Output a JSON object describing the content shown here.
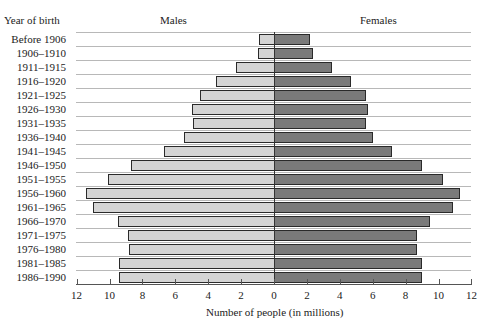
{
  "chart_data": {
    "type": "bar",
    "subtype": "population-pyramid (horizontal, back-to-back)",
    "title": "",
    "ylabel": "Year of birth",
    "xlabel": "Number of people (in millions)",
    "left_header": "Males",
    "right_header": "Females",
    "categories": [
      "Before 1906",
      "1906–1910",
      "1911–1915",
      "1916–1920",
      "1921–1925",
      "1926–1930",
      "1931–1935",
      "1936–1940",
      "1941–1945",
      "1946–1950",
      "1951–1955",
      "1956–1960",
      "1961–1965",
      "1966–1970",
      "1971–1975",
      "1976–1980",
      "1981–1985",
      "1986–1990"
    ],
    "series": [
      {
        "name": "Males",
        "color": "#d4d4d4",
        "side": "left",
        "values": [
          0.9,
          1.0,
          2.3,
          3.5,
          4.5,
          5.0,
          4.9,
          5.5,
          6.7,
          8.7,
          10.1,
          11.4,
          11.0,
          9.5,
          8.9,
          8.8,
          9.4,
          9.4
        ]
      },
      {
        "name": "Females",
        "color": "#7a7a7a",
        "side": "right",
        "values": [
          2.2,
          2.4,
          3.5,
          4.7,
          5.6,
          5.7,
          5.6,
          6.0,
          7.2,
          9.0,
          10.3,
          11.3,
          10.9,
          9.5,
          8.7,
          8.7,
          9.0,
          9.0
        ]
      }
    ],
    "x_ticks_left": [
      "12",
      "10",
      "8",
      "6",
      "4",
      "2"
    ],
    "x_ticks_right": [
      "0",
      "2",
      "4",
      "6",
      "8",
      "10",
      "12"
    ],
    "xlim": [
      -12,
      12
    ],
    "grid": "horizontal row separators",
    "legend": "column headers above each side"
  }
}
